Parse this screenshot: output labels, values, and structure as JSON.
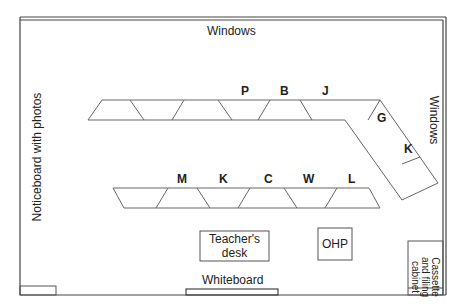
{
  "room": {
    "top_wall_label": "Windows",
    "right_wall_label": "Windows",
    "left_wall_label": "Noticeboard with photos",
    "bottom_wall_label": "Whiteboard"
  },
  "furniture": {
    "teacher_desk": "Teacher's\ndesk",
    "teacher_desk_line1": "Teacher's",
    "teacher_desk_line2": "desk",
    "ohp": "OHP",
    "cabinet_line1": "Cassette",
    "cabinet_line2": "and filing",
    "cabinet_line3": "cabinet"
  },
  "top_row_students": {
    "labels": [
      "P",
      "B",
      "J"
    ],
    "angled_labels": [
      "G",
      "K"
    ]
  },
  "bottom_row_students": {
    "labels": [
      "M",
      "K",
      "C",
      "W",
      "L"
    ]
  },
  "colors": {
    "line": "#555555",
    "wall": "#444444",
    "text": "#222222"
  }
}
